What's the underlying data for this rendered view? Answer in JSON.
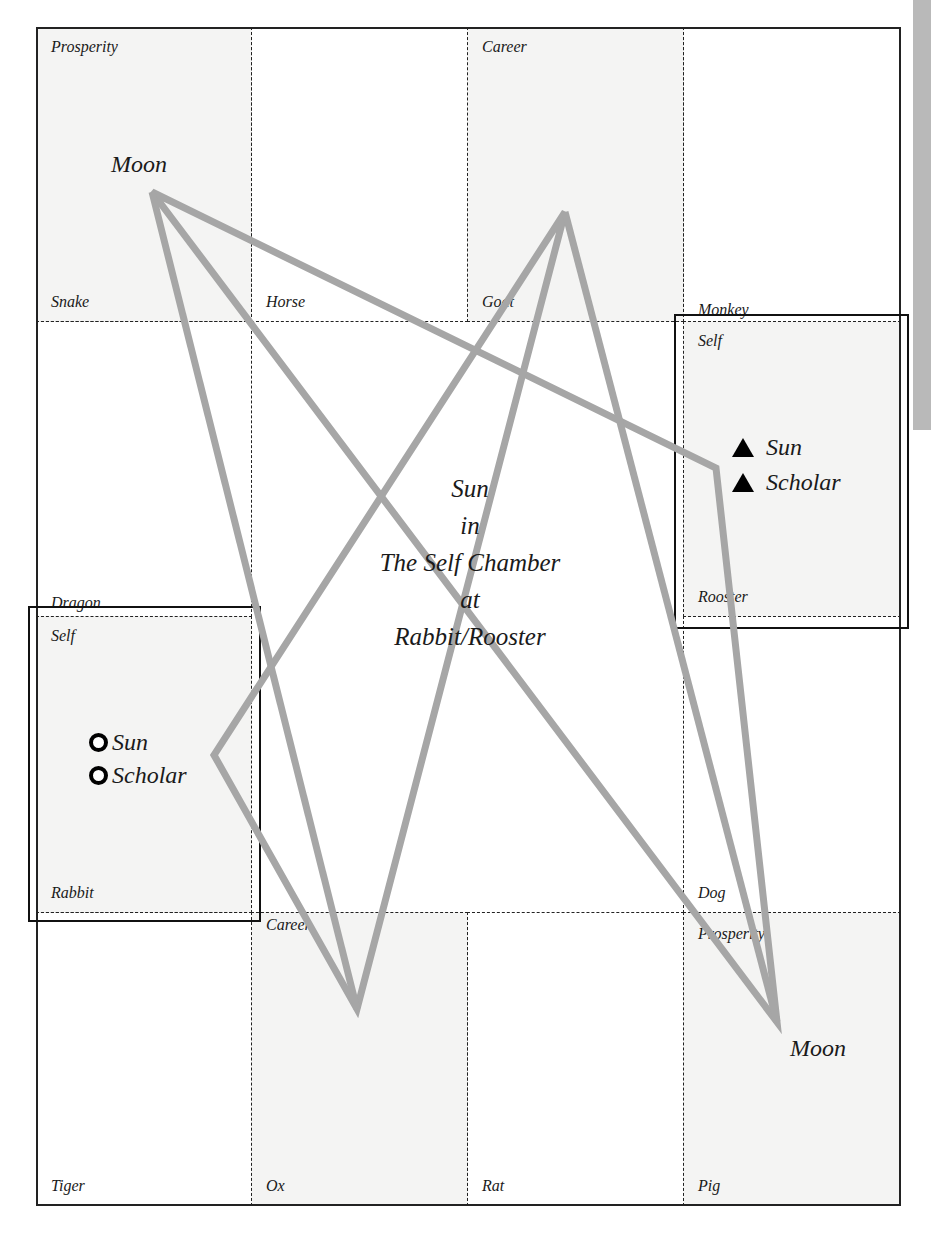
{
  "diagram": {
    "type": "zodiac palace chart (3x4 border grid)",
    "center": {
      "lines": [
        "Sun",
        "in",
        "The Self Chamber",
        "at",
        "Rabbit/Rooster"
      ]
    },
    "cells": {
      "snake": {
        "top": "Prosperity",
        "bottom": "Snake"
      },
      "horse": {
        "top": "",
        "bottom": "Horse"
      },
      "goat": {
        "top": "Career",
        "bottom": "Goat"
      },
      "monkey": {
        "top": "",
        "bottom": "Monkey"
      },
      "dragon": {
        "top": "",
        "bottom": "Dragon"
      },
      "rooster": {
        "top": "Self",
        "bottom": "Rooster"
      },
      "rabbit": {
        "top": "Self",
        "bottom": "Rabbit"
      },
      "dog": {
        "top": "",
        "bottom": "Dog"
      },
      "tiger": {
        "top": "",
        "bottom": "Tiger"
      },
      "ox": {
        "top": "Career",
        "bottom": "Ox"
      },
      "rat": {
        "top": "",
        "bottom": "Rat"
      },
      "pig": {
        "top": "Prosperity",
        "bottom": "Pig"
      }
    },
    "stars": {
      "moon_top": "Moon",
      "moon_bottom": "Moon"
    },
    "markers": {
      "rooster": [
        {
          "symbol": "triangle",
          "label": "Sun"
        },
        {
          "symbol": "triangle",
          "label": "Scholar"
        }
      ],
      "rabbit": [
        {
          "symbol": "ring",
          "label": "Sun"
        },
        {
          "symbol": "ring",
          "label": "Scholar"
        }
      ]
    },
    "colors": {
      "line": "#222222",
      "triangle_stroke": "#a6a6a6",
      "shaded_cell": "#f4f4f3",
      "side_tab": "#b9b9b9"
    }
  }
}
